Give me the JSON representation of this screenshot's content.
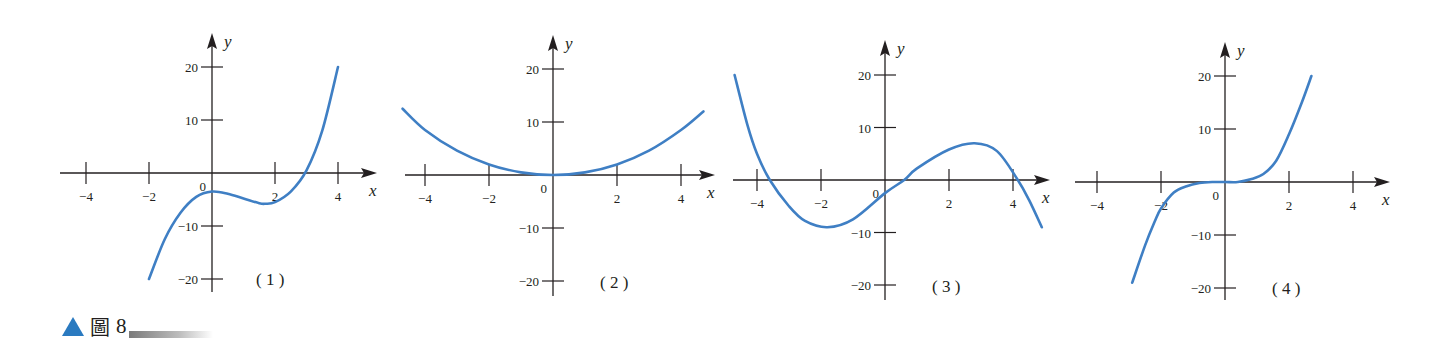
{
  "caption": {
    "marker": "▲",
    "figure_char": "圖",
    "figure_number": "8"
  },
  "colors": {
    "curve": "#3f7fc4",
    "axis": "#231f20",
    "caption_marker": "#2a7ac0"
  },
  "chart_data": [
    {
      "type": "line",
      "panel_label": "(1)",
      "xlabel": "x",
      "ylabel": "y",
      "x_ticks": [
        -4,
        -2,
        2,
        4
      ],
      "x_tick_labels": [
        "-4",
        "-2",
        "2",
        "4"
      ],
      "y_ticks": [
        20,
        10,
        -10,
        -20
      ],
      "y_tick_labels": [
        "20",
        "10",
        "-10",
        "-20"
      ],
      "origin_label": "0",
      "xlim": [
        -4.8,
        5.3
      ],
      "ylim": [
        -22,
        26
      ],
      "grid": false,
      "layout": {
        "origin": [
          212,
          173
        ],
        "px_per_x": 31.5,
        "px_per_y": 5.3,
        "x_axis": [
          60,
          377
        ],
        "y_axis": [
          33,
          292
        ],
        "label_pos": [
          256,
          285
        ]
      },
      "series": [
        {
          "name": "curve 1",
          "x": [
            -2,
            -1.5,
            -1,
            -0.5,
            0,
            0.5,
            1,
            1.5,
            1.7,
            2,
            2.5,
            3,
            3.5,
            4
          ],
          "y": [
            -20,
            -12.5,
            -7.5,
            -4.5,
            -3.5,
            -3.9,
            -4.8,
            -5.7,
            -5.8,
            -5.5,
            -3.5,
            0.5,
            8,
            20
          ]
        }
      ]
    },
    {
      "type": "line",
      "panel_label": "(2)",
      "xlabel": "x",
      "ylabel": "y",
      "x_ticks": [
        -4,
        -2,
        2,
        4
      ],
      "x_tick_labels": [
        "-4",
        "-2",
        "2",
        "4"
      ],
      "y_ticks": [
        20,
        10,
        -10,
        -20
      ],
      "y_tick_labels": [
        "20",
        "10",
        "-10",
        "-20"
      ],
      "origin_label": "0",
      "xlim": [
        -4.9,
        5.1
      ],
      "ylim": [
        -22,
        26
      ],
      "grid": false,
      "layout": {
        "origin": [
          553,
          175
        ],
        "px_per_x": 32,
        "px_per_y": 5.3,
        "x_axis": [
          405,
          715
        ],
        "y_axis": [
          35,
          296
        ],
        "label_pos": [
          600,
          288
        ]
      },
      "series": [
        {
          "name": "curve 2",
          "x": [
            -4.7,
            -4,
            -3,
            -2,
            -1,
            0,
            1,
            2,
            3,
            4,
            4.7
          ],
          "y": [
            12.5,
            8.5,
            4.6,
            2,
            0.5,
            0,
            0.5,
            2,
            4.6,
            8.5,
            12
          ]
        }
      ]
    },
    {
      "type": "line",
      "panel_label": "(3)",
      "xlabel": "x",
      "ylabel": "y",
      "x_ticks": [
        -4,
        -2,
        2,
        4
      ],
      "x_tick_labels": [
        "-4",
        "-2",
        "2",
        "4"
      ],
      "y_ticks": [
        20,
        10,
        -10,
        -20
      ],
      "y_tick_labels": [
        "20",
        "10",
        "-10",
        "-20"
      ],
      "origin_label": "0",
      "xlim": [
        -4.8,
        5.2
      ],
      "ylim": [
        -22,
        26
      ],
      "grid": false,
      "layout": {
        "origin": [
          885,
          180
        ],
        "px_per_x": 32,
        "px_per_y": 5.25,
        "x_axis": [
          733,
          1050
        ],
        "y_axis": [
          40,
          300
        ],
        "label_pos": [
          932,
          292
        ]
      },
      "series": [
        {
          "name": "curve 3",
          "x": [
            -4.7,
            -4.3,
            -4,
            -3.6,
            -3,
            -2.5,
            -1.8,
            -1,
            0,
            0.6,
            1,
            2,
            2.8,
            3.5,
            4.15,
            4.5,
            4.9
          ],
          "y": [
            20,
            10.5,
            5,
            0,
            -5,
            -7.8,
            -9,
            -7.5,
            -2.5,
            0,
            2.2,
            5.8,
            7,
            5.5,
            0,
            -3.8,
            -9
          ]
        }
      ]
    },
    {
      "type": "line",
      "panel_label": "(4)",
      "xlabel": "x",
      "ylabel": "y",
      "x_ticks": [
        -4,
        -2,
        2,
        4
      ],
      "x_tick_labels": [
        "-4",
        "-2",
        "2",
        "4"
      ],
      "y_ticks": [
        20,
        10,
        -10,
        -20
      ],
      "y_tick_labels": [
        "20",
        "10",
        "-10",
        "-20"
      ],
      "origin_label": "0",
      "xlim": [
        -4.7,
        5.2
      ],
      "ylim": [
        -22,
        26
      ],
      "grid": false,
      "layout": {
        "origin": [
          1225,
          182
        ],
        "px_per_x": 32,
        "px_per_y": 5.3,
        "x_axis": [
          1075,
          1390
        ],
        "y_axis": [
          42,
          300
        ],
        "label_pos": [
          1272,
          294
        ]
      },
      "series": [
        {
          "name": "curve 4",
          "x": [
            -2.9,
            -2.5,
            -2.2,
            -2,
            -1.6,
            -1.2,
            -0.8,
            -0.4,
            0,
            0.4,
            0.8,
            1.2,
            1.6,
            2,
            2.4,
            2.7
          ],
          "y": [
            -19,
            -12,
            -7.5,
            -5,
            -2,
            -0.8,
            -0.2,
            0,
            0,
            0,
            0.5,
            1.5,
            4,
            9,
            15,
            20
          ]
        }
      ]
    }
  ]
}
